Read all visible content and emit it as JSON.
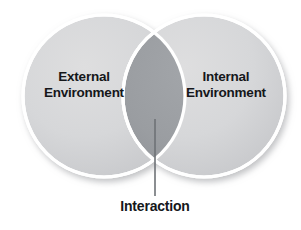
{
  "diagram": {
    "type": "venn-2-circle",
    "background_color": "#ffffff",
    "title": "",
    "left_circle": {
      "label_line1": "External",
      "label_line2": "Environment",
      "fill_color": "#d4d5d7",
      "stroke_color": "#ffffff",
      "center_x": 104,
      "center_y": 96,
      "radius": 81
    },
    "right_circle": {
      "label_line1": "Internal",
      "label_line2": "Environment",
      "fill_color": "#d4d5d7",
      "stroke_color": "#ffffff",
      "center_x": 204,
      "center_y": 96,
      "radius": 81
    },
    "intersection": {
      "label": "Interaction",
      "fill_color": "#9a9da1"
    },
    "leader_line": {
      "color": "#6e7276",
      "from_x": 155,
      "from_y": 119,
      "to_x": 155,
      "to_y": 196
    },
    "text_color": "#15171a"
  }
}
